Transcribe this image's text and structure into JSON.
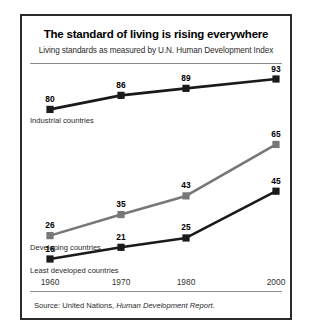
{
  "chart_data": {
    "type": "line",
    "title": "The standard of living is rising everywhere",
    "subtitle": "Living standards as measured by U.N. Human Development Index",
    "xlabel": "",
    "ylabel": "",
    "categories": [
      "1960",
      "1970",
      "1980",
      "2000"
    ],
    "x": [
      1960,
      1970,
      1980,
      2000
    ],
    "xlim": [
      1960,
      2000
    ],
    "ylim": [
      0,
      100
    ],
    "grid": false,
    "legend_position": "inline-left",
    "series": [
      {
        "name": "Industrial countries",
        "color": "#1a1a1a",
        "values": [
          80,
          86,
          89,
          93
        ]
      },
      {
        "name": "Developing countries",
        "color": "#777777",
        "values": [
          26,
          35,
          43,
          65
        ]
      },
      {
        "name": "Least developed countries",
        "color": "#1a1a1a",
        "values": [
          16,
          21,
          25,
          45
        ]
      }
    ],
    "source_prefix": "Source: United Nations,",
    "source_report": "Human Development Report",
    "source_suffix": "."
  }
}
